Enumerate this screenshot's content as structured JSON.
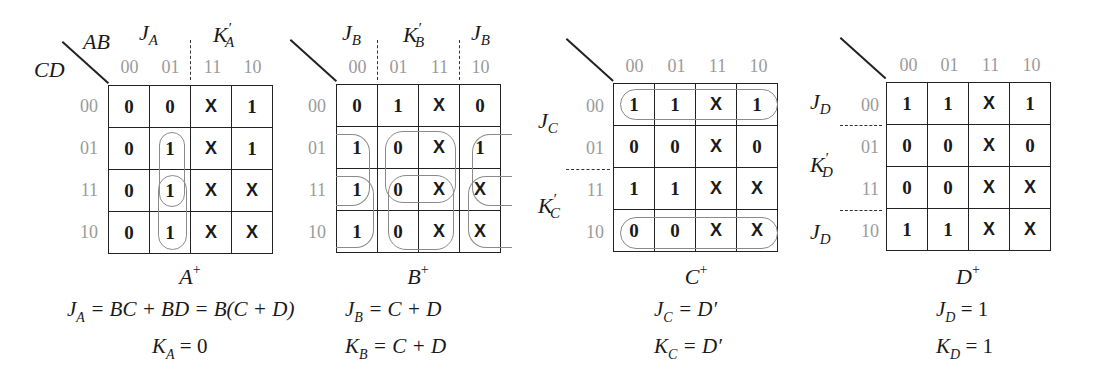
{
  "col_codes": [
    "00",
    "01",
    "11",
    "10"
  ],
  "row_codes": [
    "00",
    "01",
    "11",
    "10"
  ],
  "axis_labels": {
    "col": "AB",
    "row": "CD"
  },
  "maps": [
    {
      "name": "A",
      "title": "A",
      "title_sup": "+",
      "cells": [
        [
          "0",
          "0",
          "X",
          "1"
        ],
        [
          "0",
          "1",
          "X",
          "1"
        ],
        [
          "0",
          "1",
          "X",
          "X"
        ],
        [
          "0",
          "1",
          "X",
          "X"
        ]
      ],
      "region_labels": [
        {
          "base": "J",
          "sub": "A",
          "prime": ""
        },
        {
          "base": "K",
          "sub": "A",
          "prime": "′"
        }
      ],
      "equations": [
        {
          "lhs": "J",
          "sub": "A",
          "rhs": "= BC + BD = B(C + D)"
        },
        {
          "lhs": "K",
          "sub": "A",
          "rhs": "= 0"
        }
      ]
    },
    {
      "name": "B",
      "title": "B",
      "title_sup": "+",
      "cells": [
        [
          "0",
          "1",
          "X",
          "0"
        ],
        [
          "1",
          "0",
          "X",
          "1"
        ],
        [
          "1",
          "0",
          "X",
          "X"
        ],
        [
          "1",
          "0",
          "X",
          "X"
        ]
      ],
      "region_labels": [
        {
          "base": "J",
          "sub": "B",
          "prime": ""
        },
        {
          "base": "K",
          "sub": "B",
          "prime": "′"
        },
        {
          "base": "J",
          "sub": "B",
          "prime": ""
        }
      ],
      "equations": [
        {
          "lhs": "J",
          "sub": "B",
          "rhs": "= C + D"
        },
        {
          "lhs": "K",
          "sub": "B",
          "rhs": "= C + D"
        }
      ]
    },
    {
      "name": "C",
      "title": "C",
      "title_sup": "+",
      "cells": [
        [
          "1",
          "1",
          "X",
          "1"
        ],
        [
          "0",
          "0",
          "X",
          "0"
        ],
        [
          "1",
          "1",
          "X",
          "X"
        ],
        [
          "0",
          "0",
          "X",
          "X"
        ]
      ],
      "region_labels": [
        {
          "base": "J",
          "sub": "C",
          "prime": ""
        },
        {
          "base": "K",
          "sub": "C",
          "prime": "′"
        }
      ],
      "equations": [
        {
          "lhs": "J",
          "sub": "C",
          "rhs": "= D′"
        },
        {
          "lhs": "K",
          "sub": "C",
          "rhs": "= D′"
        }
      ]
    },
    {
      "name": "D",
      "title": "D",
      "title_sup": "+",
      "cells": [
        [
          "1",
          "1",
          "X",
          "1"
        ],
        [
          "0",
          "0",
          "X",
          "0"
        ],
        [
          "0",
          "0",
          "X",
          "X"
        ],
        [
          "1",
          "1",
          "X",
          "X"
        ]
      ],
      "region_labels": [
        {
          "base": "J",
          "sub": "D",
          "prime": ""
        },
        {
          "base": "K",
          "sub": "D",
          "prime": "′"
        },
        {
          "base": "J",
          "sub": "D",
          "prime": ""
        }
      ],
      "equations": [
        {
          "lhs": "J",
          "sub": "D",
          "rhs": "= 1"
        },
        {
          "lhs": "K",
          "sub": "D",
          "rhs": "= 1"
        }
      ]
    }
  ]
}
